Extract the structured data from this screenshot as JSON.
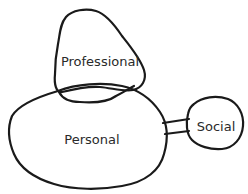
{
  "diagram": {
    "type": "hand-drawn-blob-diagram",
    "nodes": [
      {
        "id": "professional",
        "label": "Professional"
      },
      {
        "id": "personal",
        "label": "Personal"
      },
      {
        "id": "social",
        "label": "Social"
      }
    ],
    "relations": [
      {
        "from": "professional",
        "to": "personal",
        "kind": "overlap"
      },
      {
        "from": "personal",
        "to": "social",
        "kind": "bridge-connector"
      }
    ],
    "colors": {
      "stroke": "#1a1a1a",
      "text": "#2a2a2a",
      "background": "#ffffff"
    }
  }
}
